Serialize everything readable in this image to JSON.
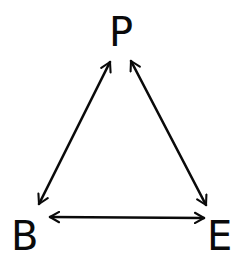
{
  "diagram": {
    "type": "triangle-relationship",
    "nodes": [
      {
        "id": "P",
        "label": "P"
      },
      {
        "id": "B",
        "label": "B"
      },
      {
        "id": "E",
        "label": "E"
      }
    ],
    "edges": [
      {
        "from": "P",
        "to": "B",
        "direction": "bidirectional"
      },
      {
        "from": "P",
        "to": "E",
        "direction": "bidirectional"
      },
      {
        "from": "B",
        "to": "E",
        "direction": "bidirectional"
      }
    ],
    "colors": {
      "ink": "#0a0a0a",
      "background": "#ffffff"
    }
  }
}
